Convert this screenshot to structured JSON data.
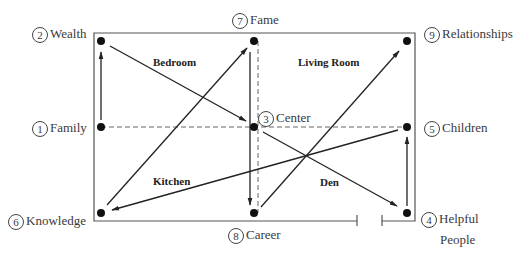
{
  "diagram": {
    "title": "",
    "colors": {
      "line": "#2a2a2a",
      "frame": "#555555",
      "dashed": "#666666"
    },
    "positions": [
      {
        "number": "1",
        "label": "Family"
      },
      {
        "number": "2",
        "label": "Wealth"
      },
      {
        "number": "3",
        "label": "Center"
      },
      {
        "number": "4",
        "label": "Helpful",
        "label2": "People"
      },
      {
        "number": "5",
        "label": "Children"
      },
      {
        "number": "6",
        "label": "Knowledge"
      },
      {
        "number": "7",
        "label": "Fame"
      },
      {
        "number": "8",
        "label": "Career"
      },
      {
        "number": "9",
        "label": "Relationships"
      }
    ],
    "rooms": {
      "bedroom": "Bedroom",
      "living_room": "Living Room",
      "kitchen": "Kitchen",
      "den": "Den"
    },
    "arrows": [
      {
        "from": "1",
        "to": "2"
      },
      {
        "from": "2",
        "to": "3"
      },
      {
        "from": "3",
        "to": "8"
      },
      {
        "from": "8",
        "to": "9"
      },
      {
        "from": "3",
        "to": "4"
      },
      {
        "from": "4",
        "to": "5"
      },
      {
        "from": "5",
        "to": "6"
      },
      {
        "from": "6",
        "to": "7"
      }
    ]
  }
}
